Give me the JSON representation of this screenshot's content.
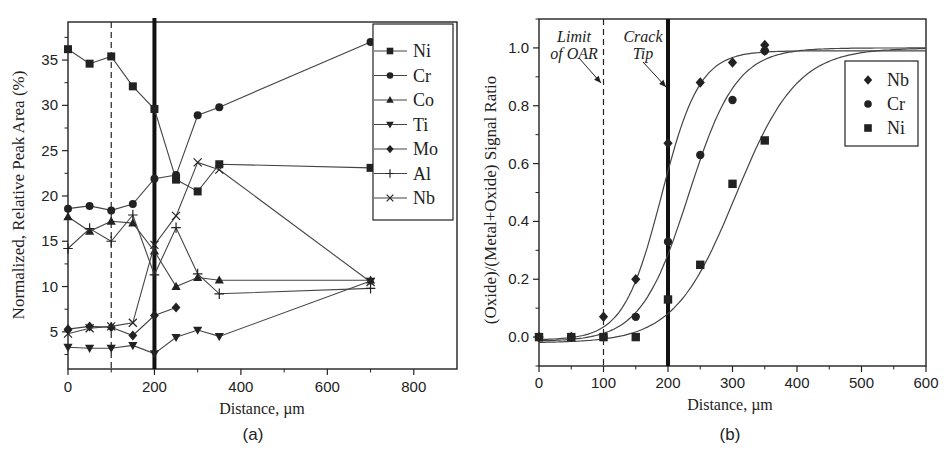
{
  "figure": {
    "panels": [
      "(a)",
      "(b)"
    ]
  },
  "chart_data": [
    {
      "type": "line",
      "panel_label": "(a)",
      "title": "",
      "xlabel": "Distance, µm",
      "ylabel": "Normalized, Relative Peak Area (%)",
      "xlim": [
        0,
        900
      ],
      "ylim": [
        0.9,
        39.2
      ],
      "xticks": [
        0,
        200,
        400,
        600,
        800
      ],
      "yticks": [
        5,
        10,
        15,
        20,
        25,
        30,
        35
      ],
      "grid": false,
      "legend_position": "upper right",
      "reference_lines": [
        {
          "x": 100,
          "style": "dashed"
        },
        {
          "x": 200,
          "style": "thick"
        }
      ],
      "series": [
        {
          "name": "Ni",
          "marker": "square",
          "x": [
            0,
            50,
            100,
            150,
            200,
            250,
            300,
            350,
            700
          ],
          "values": [
            36.2,
            34.6,
            35.4,
            32.1,
            29.6,
            21.8,
            20.5,
            23.5,
            23.1
          ]
        },
        {
          "name": "Cr",
          "marker": "circle",
          "x": [
            0,
            50,
            100,
            150,
            200,
            250,
            300,
            350,
            700
          ],
          "values": [
            18.6,
            18.9,
            18.4,
            19.1,
            21.9,
            22.3,
            28.9,
            29.8,
            37.0
          ]
        },
        {
          "name": "Co",
          "marker": "triangle-up",
          "x": [
            0,
            50,
            100,
            150,
            200,
            250,
            300,
            350,
            700
          ],
          "values": [
            17.7,
            16.1,
            17.2,
            17.0,
            13.9,
            10.0,
            11.0,
            10.7,
            10.7
          ]
        },
        {
          "name": "Ti",
          "marker": "triangle-down",
          "x": [
            0,
            50,
            100,
            150,
            200,
            250,
            300,
            350,
            700
          ],
          "values": [
            3.3,
            3.2,
            3.2,
            3.5,
            2.6,
            4.4,
            5.2,
            4.5,
            10.6
          ]
        },
        {
          "name": "Mo",
          "marker": "diamond",
          "x": [
            0,
            50,
            100,
            150,
            200,
            250
          ],
          "values": [
            5.3,
            5.6,
            5.5,
            4.6,
            6.8,
            7.7
          ]
        },
        {
          "name": "Al",
          "marker": "plus",
          "x": [
            0,
            50,
            100,
            150,
            200,
            250,
            300,
            350,
            700
          ],
          "values": [
            14.2,
            16.4,
            15.0,
            17.9,
            11.3,
            16.5,
            11.4,
            9.2,
            9.8
          ]
        },
        {
          "name": "Nb",
          "marker": "x",
          "x": [
            0,
            50,
            100,
            150,
            200,
            250,
            300,
            350,
            700
          ],
          "values": [
            4.8,
            5.4,
            5.6,
            6.0,
            14.6,
            17.8,
            23.7,
            22.9,
            10.5
          ]
        }
      ]
    },
    {
      "type": "scatter",
      "panel_label": "(b)",
      "title": "",
      "xlabel": "Distance, µm",
      "ylabel": "(Oxide)/(Metal+Oxide) Signal Ratio",
      "xlim": [
        0,
        600
      ],
      "ylim": [
        -0.1,
        1.1
      ],
      "xticks": [
        0,
        100,
        200,
        300,
        400,
        500,
        600
      ],
      "yticks": [
        0.0,
        0.2,
        0.4,
        0.6,
        0.8,
        1.0
      ],
      "grid": false,
      "legend_position": "upper right",
      "annotations": [
        {
          "text_lines": [
            "Limit",
            "of OAR"
          ],
          "points_to_x": 100
        },
        {
          "text_lines": [
            "Crack",
            "Tip"
          ],
          "points_to_x": 200
        }
      ],
      "reference_lines": [
        {
          "x": 100,
          "style": "dashed"
        },
        {
          "x": 200,
          "style": "thick"
        }
      ],
      "series": [
        {
          "name": "Nb",
          "marker": "diamond",
          "x": [
            0,
            50,
            100,
            150,
            200,
            250,
            300,
            350,
            350
          ],
          "values": [
            0.0,
            0.0,
            0.07,
            0.2,
            0.67,
            0.88,
            0.95,
            0.99,
            1.01
          ],
          "fit": {
            "type": "sigmoid",
            "x0": 190,
            "k": 0.034,
            "low": -0.01,
            "high": 0.99
          }
        },
        {
          "name": "Cr",
          "marker": "circle",
          "x": [
            0,
            50,
            100,
            150,
            200,
            250,
            300,
            350
          ],
          "values": [
            0.0,
            0.0,
            0.0,
            0.07,
            0.33,
            0.63,
            0.82,
            0.99
          ],
          "fit": {
            "type": "sigmoid",
            "x0": 232,
            "k": 0.027,
            "low": -0.015,
            "high": 1.0
          }
        },
        {
          "name": "Ni",
          "marker": "square",
          "x": [
            0,
            50,
            100,
            150,
            200,
            250,
            300,
            350
          ],
          "values": [
            0.0,
            0.0,
            0.0,
            0.0,
            0.13,
            0.25,
            0.53,
            0.68
          ],
          "fit": {
            "type": "sigmoid",
            "x0": 305,
            "k": 0.021,
            "low": -0.02,
            "high": 1.0
          }
        }
      ]
    }
  ]
}
